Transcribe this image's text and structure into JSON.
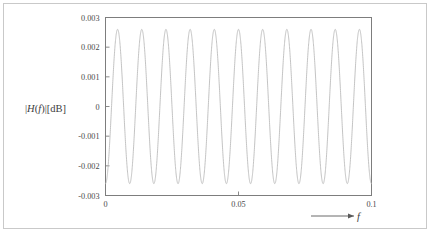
{
  "figure": {
    "background_color": "#ffffff",
    "border_color": "#c9c9c9",
    "axis_color": "#7d7d7d",
    "curve_color": "#b8b8b8"
  },
  "axis_labels": {
    "y_title_prefix": "|",
    "y_title_H": "H",
    "y_title_open": "(",
    "y_title_f": "f",
    "y_title_close": ")",
    "y_title_bar": "|",
    "y_title_unit": "[dB]",
    "x_title_f": "f"
  },
  "chart_data": {
    "type": "line",
    "title": "",
    "xlabel": "f",
    "ylabel": "|H(f)|[dB]",
    "xlim": [
      0,
      0.1
    ],
    "ylim": [
      -0.003,
      0.003
    ],
    "grid": false,
    "legend": null,
    "xticks": [
      0,
      0.05,
      0.1
    ],
    "xtick_labels": [
      "0",
      "0.05",
      "0.1"
    ],
    "yticks": [
      0.003,
      0.002,
      0.001,
      0,
      -0.001,
      -0.002,
      -0.003
    ],
    "ytick_labels": [
      "0.003",
      "0.002",
      "0.001",
      "0",
      "-0.001",
      "-0.002",
      "-0.003"
    ],
    "series": [
      {
        "name": "|H(f)| ripple",
        "description": "sinusoidal passband ripple, ~11 cycles over 0 to 0.1, amplitude 0.0026",
        "amplitude": 0.0026,
        "cycles": 11.0,
        "phase_deg": -90,
        "x": [
          0.0,
          0.0005,
          0.001,
          0.0015,
          0.002,
          0.0025,
          0.003,
          0.0035,
          0.004,
          0.0045,
          0.005,
          0.0055,
          0.006,
          0.0065,
          0.007,
          0.0075,
          0.008,
          0.0085,
          0.009,
          0.0095,
          0.01,
          0.0105,
          0.011,
          0.0115,
          0.012,
          0.0125,
          0.013,
          0.0135,
          0.014,
          0.0145,
          0.015,
          0.0155,
          0.016,
          0.0165,
          0.017,
          0.0175,
          0.018,
          0.0185,
          0.019,
          0.0195,
          0.02,
          0.0205,
          0.021,
          0.0215,
          0.022,
          0.0225,
          0.023,
          0.0235,
          0.024,
          0.0245,
          0.025,
          0.0255,
          0.026,
          0.0265,
          0.027,
          0.0275,
          0.028,
          0.0285,
          0.029,
          0.0295,
          0.03,
          0.0305,
          0.031,
          0.0315,
          0.032,
          0.0325,
          0.033,
          0.0335,
          0.034,
          0.0345,
          0.035,
          0.0355,
          0.036,
          0.0365,
          0.037,
          0.0375,
          0.038,
          0.0385,
          0.039,
          0.0395,
          0.04,
          0.0405,
          0.041,
          0.0415,
          0.042,
          0.0425,
          0.043,
          0.0435,
          0.044,
          0.0445,
          0.045,
          0.0455,
          0.046,
          0.0465,
          0.047,
          0.0475,
          0.048,
          0.0485,
          0.049,
          0.0495,
          0.05,
          0.0505,
          0.051,
          0.0515,
          0.052,
          0.0525,
          0.053,
          0.0535,
          0.054,
          0.0545,
          0.055,
          0.0555,
          0.056,
          0.0565,
          0.057,
          0.0575,
          0.058,
          0.0585,
          0.059,
          0.0595,
          0.06,
          0.0605,
          0.061,
          0.0615,
          0.062,
          0.0625,
          0.063,
          0.0635,
          0.064,
          0.0645,
          0.065,
          0.0655,
          0.066,
          0.0665,
          0.067,
          0.0675,
          0.068,
          0.0685,
          0.069,
          0.0695,
          0.07,
          0.0705,
          0.071,
          0.0715,
          0.072,
          0.0725,
          0.073,
          0.0735,
          0.074,
          0.0745,
          0.075,
          0.0755,
          0.076,
          0.0765,
          0.077,
          0.0775,
          0.078,
          0.0785,
          0.079,
          0.0795,
          0.08,
          0.0805,
          0.081,
          0.0815,
          0.082,
          0.0825,
          0.083,
          0.0835,
          0.084,
          0.0845,
          0.085,
          0.0855,
          0.086,
          0.0865,
          0.087,
          0.0875,
          0.088,
          0.0885,
          0.089,
          0.0895,
          0.09,
          0.0905,
          0.091,
          0.0915,
          0.092,
          0.0925,
          0.093,
          0.0935,
          0.094,
          0.0945,
          0.095,
          0.0955,
          0.096,
          0.0965,
          0.097,
          0.0975,
          0.098,
          0.0985,
          0.099,
          0.0995,
          0.1
        ]
      }
    ]
  }
}
